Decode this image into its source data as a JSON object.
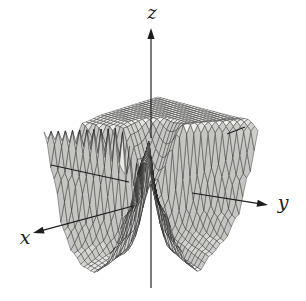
{
  "figure": {
    "kind": "textbook 3D surface graph",
    "background": "#ffffff"
  },
  "chart_data": {
    "type": "surface",
    "title": "",
    "axes": {
      "x": "x",
      "y": "y",
      "z": "z"
    },
    "tick_labels": [],
    "legend": null,
    "surface_model": {
      "grid_divisions": 30,
      "domain_half": 1,
      "radial_ramp": 0.45,
      "rim_deepen": 0.32,
      "angular_profile_deg": [
        [
          0,
          -1.05
        ],
        [
          12,
          -0.92
        ],
        [
          22,
          -0.6
        ],
        [
          33,
          -0.05
        ],
        [
          45,
          0.95
        ],
        [
          57,
          -0.05
        ],
        [
          68,
          -0.62
        ],
        [
          78,
          -0.95
        ],
        [
          88,
          -1.1
        ],
        [
          100,
          -0.9
        ],
        [
          112,
          -0.74
        ],
        [
          123,
          -0.42
        ],
        [
          130,
          0.15
        ],
        [
          136,
          0.92
        ],
        [
          141,
          1.02
        ],
        [
          152,
          1.0
        ],
        [
          190,
          1.0
        ],
        [
          230,
          1.0
        ],
        [
          268,
          1.0
        ],
        [
          288,
          0.96
        ],
        [
          298,
          0.5
        ],
        [
          304,
          -0.05
        ],
        [
          309,
          0.4
        ],
        [
          315,
          1.02
        ],
        [
          321,
          0.25
        ],
        [
          328,
          -0.5
        ],
        [
          337,
          -0.82
        ],
        [
          348,
          -1.0
        ],
        [
          360,
          -1.05
        ]
      ]
    },
    "projection": {
      "origin_px": [
        151,
        185
      ],
      "x_step_px": [
        -57,
        18
      ],
      "y_step_px": [
        50,
        13
      ],
      "z_step_px": 57,
      "depth_order_key": [
        1,
        1.1,
        0.59
      ],
      "light_dir": [
        -0.45,
        -0.18,
        0.88
      ]
    },
    "axis_segments": [
      {
        "name": "z-axis-positive",
        "from": [
          151,
          138
        ],
        "to": [
          151,
          28
        ],
        "arrow": true
      },
      {
        "name": "z-axis-negative",
        "from": [
          151,
          184
        ],
        "to": [
          151,
          288
        ],
        "arrow": false
      },
      {
        "name": "x-axis-positive",
        "from": [
          133,
          206
        ],
        "to": [
          33,
          233
        ],
        "arrow": true
      },
      {
        "name": "x-axis-negative-tail",
        "from": [
          227,
          134
        ],
        "to": [
          245,
          127
        ],
        "arrow": false
      },
      {
        "name": "y-axis-positive",
        "from": [
          192,
          193
        ],
        "to": [
          268,
          205
        ],
        "arrow": true
      },
      {
        "name": "y-axis-negative-tail",
        "from": [
          51,
          165
        ],
        "to": [
          129,
          182
        ],
        "arrow": false
      }
    ],
    "label_positions": {
      "x": {
        "x": 25,
        "y": 244
      },
      "y": {
        "x": 283,
        "y": 209
      },
      "z": {
        "x": 152,
        "y": 19
      }
    },
    "colors": {
      "stroke": "#222222",
      "axis": "#1c1c1c",
      "background": "#ffffff",
      "fill_light": "#f6f6f3",
      "fill_dark": "#c9c9c4"
    }
  }
}
